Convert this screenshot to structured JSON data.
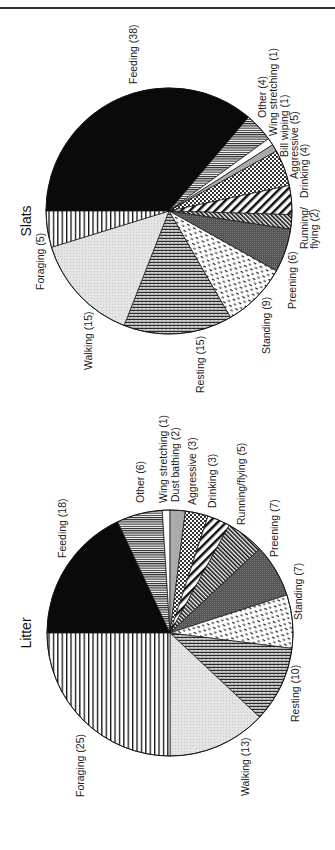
{
  "figure": {
    "orientation": "rotated 90 degrees clockwise (text reads bottom-to-top)"
  },
  "chart_data": [
    {
      "type": "pie",
      "title": "Slats",
      "start_slice_note": "Feeding begins at left horizontal, slices proceed clockwise",
      "categories": [
        "Feeding",
        "Other",
        "Wing stretching",
        "Bill wiping",
        "Aggressive",
        "Drinking",
        "Running/ flying",
        "Preening",
        "Standing",
        "Resting",
        "Walking",
        "Foraging"
      ],
      "values": [
        38,
        4,
        1,
        1,
        5,
        4,
        2,
        6,
        9,
        15,
        15,
        5
      ],
      "labels": [
        "Feeding (38)",
        "Other (4)",
        "Wing stretching (1)",
        "Bill wiping (1)",
        "Aggressive (5)",
        "Drinking (4)",
        "Running/ flying (2)",
        "Preening (6)",
        "Standing (9)",
        "Resting (15)",
        "Walking (15)",
        "Foraging (5)"
      ],
      "patterns": [
        "solid-black",
        "horizontal-lines-dense",
        "white",
        "light-gray",
        "crosshatch-dots",
        "diagonal-stripes-wide",
        "diagonal-stripes-dense",
        "dark-gray-stipple",
        "dashes",
        "zigzag",
        "light-gray-stipple",
        "vertical-lines"
      ]
    },
    {
      "type": "pie",
      "title": "Litter",
      "start_slice_note": "Feeding begins at left horizontal, slices proceed clockwise",
      "categories": [
        "Feeding",
        "Other",
        "Wing stretching",
        "Dust bathing",
        "Aggressive",
        "Drinking",
        "Running/flying",
        "Preening",
        "Standing",
        "Resting",
        "Walking",
        "Foraging"
      ],
      "values": [
        18,
        6,
        1,
        2,
        3,
        3,
        5,
        7,
        7,
        10,
        13,
        25
      ],
      "labels": [
        "Feeding (18)",
        "Other (6)",
        "Wing stretching (1)",
        "Dust bathing (2)",
        "Aggressive (3)",
        "Drinking (3)",
        "Running/flying (5)",
        "Preening (7)",
        "Standing (7)",
        "Resting (10)",
        "Walking (13)",
        "Foraging (25)"
      ],
      "patterns": [
        "solid-black",
        "horizontal-lines-dense",
        "white",
        "light-gray",
        "crosshatch-dots",
        "diagonal-stripes-wide",
        "diagonal-stripes-dense",
        "dark-gray-stipple",
        "dashes",
        "zigzag",
        "light-gray-stipple",
        "vertical-lines"
      ]
    }
  ],
  "pies": {
    "slats": {
      "title": "Slats",
      "labels": {
        "feeding": "Feeding (38)",
        "other": "Other (4)",
        "wing": "Wing stretching (1)",
        "bill": "Bill wiping (1)",
        "aggressive": "Aggressive (5)",
        "drinking": "Drinking (4)",
        "running1": "Running/",
        "running2": "flying (2)",
        "preening": "Preening (6)",
        "standing": "Standing (9)",
        "resting": "Resting (15)",
        "walking": "Walking (15)",
        "foraging": "Foraging (5)"
      }
    },
    "litter": {
      "title": "Litter",
      "labels": {
        "feeding": "Feeding (18)",
        "other": "Other (6)",
        "wing": "Wing stretching (1)",
        "dust": "Dust bathing (2)",
        "aggressive": "Aggressive (3)",
        "drinking": "Drinking (3)",
        "running": "Running/flying (5)",
        "preening": "Preening (7)",
        "standing": "Standing (7)",
        "resting": "Resting (10)",
        "walking": "Walking (13)",
        "foraging": "Foraging (25)"
      }
    }
  }
}
